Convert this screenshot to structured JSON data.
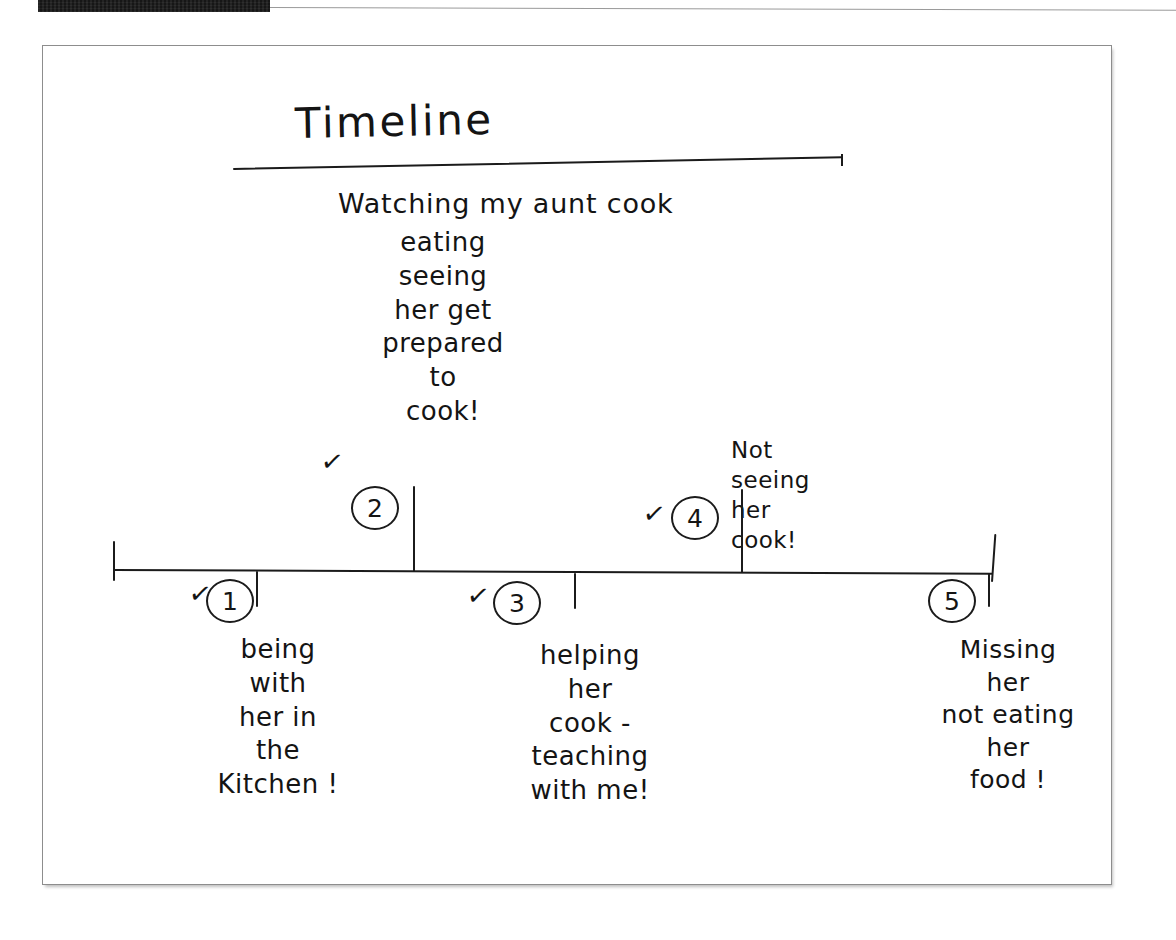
{
  "header": {
    "strip_label": "",
    "strip_color": "#1a1a1a"
  },
  "document": {
    "title": "Timeline",
    "kind": "handwritten-timeline-worksheet",
    "ink_color": "#141414",
    "paper_color": "#ffffff",
    "border_color": "#8d8d8d"
  },
  "timeline": {
    "axis_label": "",
    "left_cap": "|",
    "right_cap": "|",
    "entries": [
      {
        "number": "1",
        "checked": true,
        "check_glyph": "✓",
        "position": "below",
        "text_lines": [
          "being",
          "with",
          "her in",
          "the",
          "Kitchen !"
        ]
      },
      {
        "number": "2",
        "checked": true,
        "check_glyph": "✓",
        "position": "above",
        "text_lines": [
          "Watching my aunt cook",
          "eating",
          "seeing",
          "her get",
          "prepared",
          "to",
          "cook!"
        ]
      },
      {
        "number": "3",
        "checked": true,
        "check_glyph": "✓",
        "position": "below",
        "text_lines": [
          "helping",
          "her",
          "cook -",
          "teaching",
          "with me!"
        ]
      },
      {
        "number": "4",
        "checked": true,
        "check_glyph": "✓",
        "position": "above",
        "text_lines": [
          "Not",
          "seeing",
          "her",
          "cook!"
        ]
      },
      {
        "number": "5",
        "checked": false,
        "check_glyph": "",
        "position": "below",
        "text_lines": [
          "Missing",
          "her",
          "not eating",
          "her",
          "food !"
        ]
      }
    ]
  },
  "text_blocks": {
    "lead": "Watching my aunt cook",
    "entry2_body": "eating\nseeing\nher get\nprepared\nto\ncook!",
    "entry1_body": "being\nwith\nher in\nthe\nKitchen !",
    "entry3_body": "helping\nher\ncook -\nteaching\nwith me!",
    "entry4_body": "Not\nseeing\nher\ncook!",
    "entry5_body": "Missing\nher\nnot eating\nher\nfood !"
  }
}
